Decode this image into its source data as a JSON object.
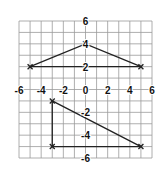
{
  "chart_data": {
    "type": "scatter",
    "title": "",
    "xlabel": "",
    "ylabel": "",
    "xlim": [
      -6,
      6
    ],
    "ylim": [
      -6,
      6
    ],
    "grid": true,
    "x_ticks": [
      "-6",
      "-4",
      "-2",
      "0",
      "2",
      "4",
      "6"
    ],
    "y_ticks": [
      "6",
      "4",
      "2",
      "-2",
      "-4",
      "-6"
    ],
    "shapes": [
      {
        "name": "triangle-upper",
        "vertices": [
          [
            -5,
            2
          ],
          [
            0,
            4
          ],
          [
            5,
            2
          ]
        ],
        "marker": "x",
        "closed": true
      },
      {
        "name": "triangle-lower",
        "vertices": [
          [
            -3,
            -1
          ],
          [
            -3,
            -5
          ],
          [
            5,
            -5
          ]
        ],
        "marker": "x",
        "closed": true
      }
    ],
    "colors": {
      "grid": "#9a9a9a",
      "lines": "#222222",
      "background": "#ffffff"
    }
  }
}
